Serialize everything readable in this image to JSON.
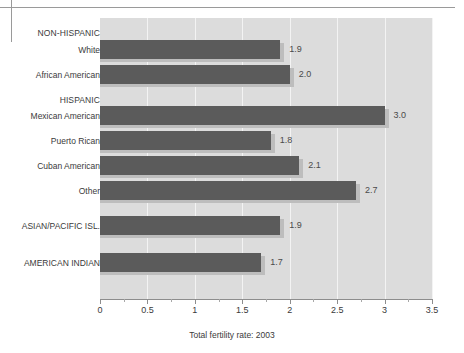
{
  "chart_data": {
    "type": "bar",
    "orientation": "horizontal",
    "title": "",
    "subtitle": "",
    "xlabel": "Total fertility rate: 2003",
    "ylabel": "",
    "xlim": [
      0,
      3.5
    ],
    "xticks": [
      "0",
      "0.5",
      "1",
      "1.5",
      "2",
      "2.5",
      "3",
      "3.5"
    ],
    "xtick_values": [
      0,
      0.5,
      1,
      1.5,
      2,
      2.5,
      3,
      3.5
    ],
    "grid": true,
    "legend": "none",
    "categories": [
      "White",
      "African American",
      "Mexican American",
      "Puerto Rican",
      "Cuban American",
      "Other",
      "ASIAN/PACIFIC ISL.",
      "AMERICAN INDIAN"
    ],
    "values": [
      1.9,
      2.0,
      3.0,
      1.8,
      2.1,
      2.7,
      1.9,
      1.7
    ],
    "value_labels": [
      "1.9",
      "2.0",
      "3.0",
      "1.8",
      "2.1",
      "2.7",
      "1.9",
      "1.7"
    ],
    "group_headers": [
      "NON-HISPANIC",
      "HISPANIC"
    ],
    "rows": [
      {
        "kind": "group",
        "label": "NON-HISPANIC",
        "top": 28
      },
      {
        "kind": "bar",
        "label": "White",
        "value": 1.9,
        "value_label": "1.9",
        "top": 40
      },
      {
        "kind": "bar",
        "label": "African American",
        "value": 2.0,
        "value_label": "2.0",
        "top": 65
      },
      {
        "kind": "group",
        "label": "HISPANIC",
        "top": 95
      },
      {
        "kind": "bar",
        "label": "Mexican American",
        "value": 3.0,
        "value_label": "3.0",
        "top": 106
      },
      {
        "kind": "bar",
        "label": "Puerto Rican",
        "value": 1.8,
        "value_label": "1.8",
        "top": 131
      },
      {
        "kind": "bar",
        "label": "Cuban American",
        "value": 2.1,
        "value_label": "2.1",
        "top": 156
      },
      {
        "kind": "bar",
        "label": "Other",
        "value": 2.7,
        "value_label": "2.7",
        "top": 181
      },
      {
        "kind": "bar",
        "label": "ASIAN/PACIFIC ISL.",
        "value": 1.9,
        "value_label": "1.9",
        "top": 216
      },
      {
        "kind": "bar",
        "label": "AMERICAN INDIAN",
        "value": 1.7,
        "value_label": "1.7",
        "top": 253
      }
    ]
  },
  "colors": {
    "bar": "#5b5b5b",
    "bar_shadow": "#bdbdbd",
    "plot_background": "#dcdcdc",
    "gridline": "#f3f3f3",
    "axis": "#8d8d8d",
    "text": "#3a3a3a",
    "page_background": "#ffffff"
  },
  "caption": "Total fertility rate: 2003"
}
